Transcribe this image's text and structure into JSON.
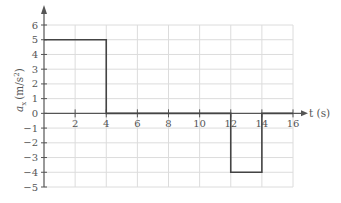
{
  "chart_data": {
    "type": "line",
    "title": "",
    "xlabel": "t (s)",
    "ylabel": "a_x (m/s^2)",
    "xlim": [
      0,
      16
    ],
    "ylim": [
      -5,
      6
    ],
    "x_ticks": [
      2,
      4,
      6,
      8,
      10,
      12,
      14,
      16
    ],
    "y_ticks": [
      6,
      5,
      4,
      3,
      2,
      1,
      0,
      -1,
      -2,
      -3,
      -4,
      -5
    ],
    "grid": true,
    "legend": null,
    "series": [
      {
        "name": "a_x(t)",
        "x": [
          0,
          4,
          4,
          12,
          12,
          14,
          14,
          16
        ],
        "y": [
          5,
          5,
          0,
          0,
          -4,
          -4,
          0,
          0
        ]
      }
    ],
    "segments": [
      {
        "t_start": 0,
        "t_end": 4,
        "a_x": 5
      },
      {
        "t_start": 4,
        "t_end": 12,
        "a_x": 0
      },
      {
        "t_start": 12,
        "t_end": 14,
        "a_x": -4
      },
      {
        "t_start": 14,
        "t_end": 16,
        "a_x": 0
      }
    ]
  },
  "labels": {
    "x_axis": "t (s)",
    "y_axis_var": "a",
    "y_axis_sub": "x",
    "y_axis_unit": "(m/s",
    "y_axis_exp": "2",
    "y_axis_close": ")"
  },
  "colors": {
    "grid": "#dcdcdc",
    "axis": "#555555",
    "line": "#444444",
    "text": "#555555"
  }
}
